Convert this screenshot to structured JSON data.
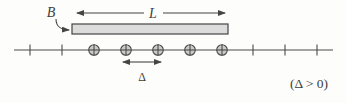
{
  "figure": {
    "labels": {
      "bar": "B",
      "length": "L",
      "spacing": "Δ",
      "condition": "(Δ > 0)"
    },
    "elements": {
      "charge_count": 5,
      "tick_count": 5,
      "charge_symbol": "circled-plus",
      "bar_shape": "horizontal-rectangle",
      "axis_shape": "horizontal-line-with-ticks"
    },
    "colors": {
      "stroke": "#454545",
      "bar_fill": "#dcdcdc",
      "charge_fill": "#cbcbcb",
      "background": "#fdfdfc"
    }
  }
}
